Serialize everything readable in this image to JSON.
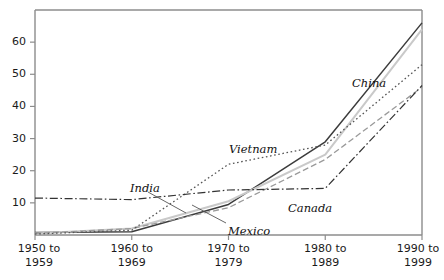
{
  "chart_data": {
    "type": "line",
    "title": "",
    "subtitle": "",
    "xlabel": "",
    "ylabel": "",
    "grid": false,
    "legend_position": "inline-labels",
    "xlim": [
      0,
      4
    ],
    "ylim": [
      0,
      70
    ],
    "y_ticks": [
      10,
      20,
      30,
      40,
      50,
      60
    ],
    "categories": [
      "1950 to 1959",
      "1960 to 1969",
      "1970 to 1979",
      "1980 to 1989",
      "1990 to 1999"
    ],
    "series": [
      {
        "name": "China",
        "style": "solid",
        "color": "#3c3c3c",
        "width": 1.5,
        "values": [
          0.8,
          1.0,
          9.5,
          29.0,
          66.0
        ]
      },
      {
        "name": "India",
        "style": "solid",
        "color": "#c9c9c9",
        "width": 2.0,
        "values": [
          0.5,
          2.0,
          10.5,
          25.0,
          64.0
        ]
      },
      {
        "name": "Mexico",
        "style": "dashed",
        "color": "#9a9a9a",
        "width": 1.3,
        "values": [
          0.5,
          2.0,
          8.5,
          23.5,
          46.0
        ]
      },
      {
        "name": "Vietnam",
        "style": "dotted",
        "color": "#555555",
        "width": 1.3,
        "values": [
          0.3,
          1.5,
          22.0,
          28.0,
          53.0
        ]
      },
      {
        "name": "Canada",
        "style": "dashdot",
        "color": "#333333",
        "width": 1.2,
        "values": [
          11.5,
          11.0,
          14.0,
          14.5,
          46.5
        ]
      }
    ],
    "annotations": [
      {
        "text": "China",
        "series": "China",
        "x_px": 352,
        "y_px": 78
      },
      {
        "text": "India",
        "series": "India",
        "x_px": 130,
        "y_px": 183
      },
      {
        "text": "Mexico",
        "series": "Mexico",
        "x_px": 228,
        "y_px": 226
      },
      {
        "text": "Vietnam",
        "series": "Vietnam",
        "x_px": 229,
        "y_px": 144
      },
      {
        "text": "Canada",
        "series": "Canada",
        "x_px": 288,
        "y_px": 203
      }
    ]
  },
  "axes": {
    "y_tick_labels": [
      "60",
      "50",
      "40",
      "30",
      "20",
      "10"
    ],
    "x_tick_labels": [
      {
        "line1": "1950 to",
        "line2": "1959"
      },
      {
        "line1": "1960 to",
        "line2": "1969"
      },
      {
        "line1": "1970 to",
        "line2": "1979"
      },
      {
        "line1": "1980 to",
        "line2": "1989"
      },
      {
        "line1": "1990 to",
        "line2": "1999"
      }
    ]
  },
  "colors": {
    "axis": "#8c8c8c",
    "text": "#1a1a1a",
    "background": "#ffffff"
  }
}
